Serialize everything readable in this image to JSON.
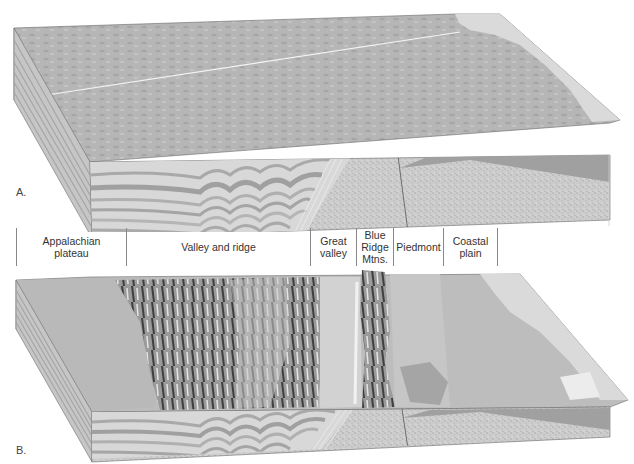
{
  "figure": {
    "panels": [
      {
        "id": "A",
        "label": "A.",
        "description": "Block diagram before erosion: flat surface over folded strata, crystalline rocks and coastal wedge"
      },
      {
        "id": "B",
        "label": "B.",
        "description": "Block diagram after erosion showing physiographic provinces"
      }
    ],
    "regions": [
      {
        "name": "Appalachian plateau",
        "line1": "Appalachian",
        "line2": "plateau",
        "line3": ""
      },
      {
        "name": "Valley and ridge",
        "line1": "Valley and ridge",
        "line2": "",
        "line3": ""
      },
      {
        "name": "Great valley",
        "line1": "Great",
        "line2": "valley",
        "line3": ""
      },
      {
        "name": "Blue Ridge Mtns.",
        "line1": "Blue",
        "line2": "Ridge",
        "line3": "Mtns."
      },
      {
        "name": "Piedmont",
        "line1": "Piedmont",
        "line2": "",
        "line3": ""
      },
      {
        "name": "Coastal plain",
        "line1": "Coastal",
        "line2": "plain",
        "line3": ""
      }
    ],
    "colors": {
      "surface": "#b4b4b4",
      "surface_light": "#d6d6d6",
      "strata_dark": "#a8a8a8",
      "strata_light": "#dcdcdc",
      "crystalline": "#cfcfcf",
      "coastal_wedge": "#9a9a9a",
      "outline": "#6a6a6a",
      "ridge_dark": "#5a5a5a"
    }
  }
}
